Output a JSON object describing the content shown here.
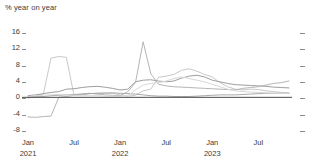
{
  "chart_data": {
    "type": "line",
    "title": "",
    "subtitle": "",
    "ylabel": "% year on year",
    "xlabel": "",
    "ylim": [
      -8,
      16
    ],
    "yticks": [
      16,
      12,
      8,
      4,
      0,
      -4,
      -8
    ],
    "grid": false,
    "legend_position": "none",
    "zero_line": 0,
    "x": [
      "2021-01",
      "2021-02",
      "2021-03",
      "2021-04",
      "2021-05",
      "2021-06",
      "2021-07",
      "2021-08",
      "2021-09",
      "2021-10",
      "2021-11",
      "2021-12",
      "2022-01",
      "2022-02",
      "2022-03",
      "2022-04",
      "2022-05",
      "2022-06",
      "2022-07",
      "2022-08",
      "2022-09",
      "2022-10",
      "2022-11",
      "2022-12",
      "2023-01",
      "2023-02",
      "2023-03",
      "2023-04",
      "2023-05",
      "2023-06",
      "2023-07",
      "2023-08",
      "2023-09",
      "2023-10",
      "2023-11"
    ],
    "xticks": [
      {
        "label": "Jan",
        "year": "2021",
        "x": "2021-01"
      },
      {
        "label": "Jul",
        "year": "",
        "x": "2021-07"
      },
      {
        "label": "Jan",
        "year": "2022",
        "x": "2022-01"
      },
      {
        "label": "Jul",
        "year": "",
        "x": "2022-07"
      },
      {
        "label": "Jan",
        "year": "2023",
        "x": "2023-01"
      },
      {
        "label": "Jul",
        "year": "",
        "x": "2023-07"
      }
    ],
    "series": [
      {
        "name": "series-1",
        "color": "#c9c9c9",
        "values": [
          -0.2,
          0.3,
          0.8,
          9.6,
          10.0,
          9.8,
          0.4,
          0.6,
          0.9,
          1.0,
          1.1,
          1.0,
          0.6,
          0.3,
          0.5,
          1.6,
          2.0,
          4.9,
          5.2,
          5.6,
          6.6,
          7.0,
          6.4,
          5.6,
          5.0,
          3.6,
          2.6,
          2.0,
          1.8,
          2.0,
          1.9,
          1.6,
          1.4,
          1.2,
          1.1
        ]
      },
      {
        "name": "series-2",
        "color": "#9e9e9e",
        "values": [
          0.4,
          0.6,
          0.9,
          1.2,
          1.4,
          2.0,
          2.1,
          2.4,
          2.6,
          2.7,
          2.5,
          2.2,
          1.8,
          2.0,
          3.8,
          4.2,
          4.3,
          4.0,
          3.8,
          4.0,
          4.7,
          5.2,
          5.4,
          5.0,
          4.2,
          3.8,
          3.4,
          3.1,
          3.0,
          2.9,
          2.8,
          2.7,
          2.5,
          2.4,
          2.3
        ]
      },
      {
        "name": "series-3",
        "color": "#b5b5b5",
        "values": [
          -4.8,
          -4.9,
          -4.7,
          -4.6,
          0.0,
          0.2,
          0.5,
          0.8,
          1.0,
          0.8,
          0.6,
          0.5,
          0.4,
          1.4,
          3.6,
          13.6,
          5.8,
          3.2,
          2.8,
          2.6,
          2.5,
          2.4,
          2.3,
          2.2,
          2.1,
          2.0,
          1.9,
          1.8,
          2.2,
          2.4,
          2.6,
          3.0,
          3.4,
          3.6,
          4.0
        ]
      },
      {
        "name": "series-4",
        "color": "#a8a8a8",
        "values": [
          0.0,
          0.1,
          0.2,
          0.4,
          0.5,
          0.6,
          0.7,
          0.8,
          0.9,
          1.0,
          1.0,
          1.1,
          1.0,
          0.9,
          0.8,
          0.6,
          0.4,
          0.3,
          0.3,
          0.2,
          0.2,
          0.2,
          0.3,
          0.4,
          0.5,
          0.6,
          0.6,
          0.6,
          0.7,
          0.8,
          0.9,
          1.0,
          1.0,
          1.0,
          1.0
        ]
      },
      {
        "name": "series-5",
        "color": "#d8d8d8",
        "values": [
          0.2,
          0.4,
          0.5,
          0.6,
          0.7,
          0.6,
          0.5,
          0.4,
          0.4,
          0.4,
          0.3,
          0.3,
          0.3,
          0.4,
          1.8,
          3.0,
          3.4,
          3.6,
          4.0,
          4.6,
          5.0,
          4.6,
          4.2,
          3.8,
          3.2,
          2.6,
          2.0,
          1.6,
          1.4,
          1.3,
          1.2,
          1.1,
          1.0,
          1.0,
          0.9
        ]
      }
    ]
  },
  "axis": {
    "y_title": "% year on year"
  }
}
